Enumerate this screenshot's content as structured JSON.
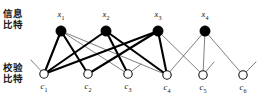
{
  "figure": {
    "type": "tanner-graph",
    "title": "",
    "labels": {
      "information_bits": "信息\n比特",
      "parity_check_bits": "校验\n比特"
    },
    "colors": {
      "variable_node_fill": "#000000",
      "check_node_fill": "#ffffff",
      "check_node_stroke": "#111111",
      "edge_thick": "#000000",
      "edge_thin": "#555555",
      "background": "#ffffff"
    },
    "variable_nodes": [
      {
        "id": "x1",
        "label": "x",
        "sub": "1",
        "cx": 61,
        "cy": 31,
        "r": 5.2
      },
      {
        "id": "x2",
        "label": "x",
        "sub": "2",
        "cx": 106,
        "cy": 31,
        "r": 5.2
      },
      {
        "id": "x3",
        "label": "x",
        "sub": "3",
        "cx": 158,
        "cy": 31,
        "r": 5.2
      },
      {
        "id": "x4",
        "label": "x",
        "sub": "4",
        "cx": 205,
        "cy": 31,
        "r": 5.2
      }
    ],
    "check_nodes": [
      {
        "id": "c1",
        "label": "c",
        "sub": "1",
        "cx": 44,
        "cy": 74,
        "r": 4.2
      },
      {
        "id": "c2",
        "label": "c",
        "sub": "2",
        "cx": 88,
        "cy": 74,
        "r": 4.2
      },
      {
        "id": "c3",
        "label": "c",
        "sub": "3",
        "cx": 128,
        "cy": 74,
        "r": 4.2
      },
      {
        "id": "c4",
        "label": "c",
        "sub": "4",
        "cx": 167,
        "cy": 75,
        "r": 4.2
      },
      {
        "id": "c5",
        "label": "c",
        "sub": "5",
        "cx": 203,
        "cy": 75,
        "r": 4.2
      },
      {
        "id": "c6",
        "label": "c",
        "sub": "6",
        "cx": 243,
        "cy": 75,
        "r": 4.2
      }
    ],
    "edges": [
      {
        "from": "x1",
        "to": "c1",
        "weight": "thick"
      },
      {
        "from": "x1",
        "to": "c2",
        "weight": "thick"
      },
      {
        "from": "x1",
        "to": "c3",
        "weight": "thin"
      },
      {
        "from": "x1",
        "to": "c4",
        "weight": "thin"
      },
      {
        "from": "x2",
        "to": "c1",
        "weight": "thick"
      },
      {
        "from": "x2",
        "to": "c3",
        "weight": "thick"
      },
      {
        "from": "x2",
        "to": "c4",
        "weight": "thick"
      },
      {
        "from": "x3",
        "to": "c1",
        "weight": "thick"
      },
      {
        "from": "x3",
        "to": "c2",
        "weight": "thick"
      },
      {
        "from": "x3",
        "to": "c4",
        "weight": "thick"
      },
      {
        "from": "x3",
        "to": "c5",
        "weight": "thin"
      },
      {
        "from": "x4",
        "to": "c4",
        "weight": "thin"
      },
      {
        "from": "x4",
        "to": "c5",
        "weight": "thin"
      },
      {
        "from": "x4",
        "to": "c6",
        "weight": "thin"
      }
    ],
    "dangling_stubs": [
      {
        "at": "c1",
        "dx": -13,
        "dy": -14
      },
      {
        "at": "c3",
        "dx": 13,
        "dy": -10
      },
      {
        "at": "c5",
        "dx": 11,
        "dy": -13
      },
      {
        "at": "c6",
        "dx": 13,
        "dy": -13
      }
    ]
  }
}
